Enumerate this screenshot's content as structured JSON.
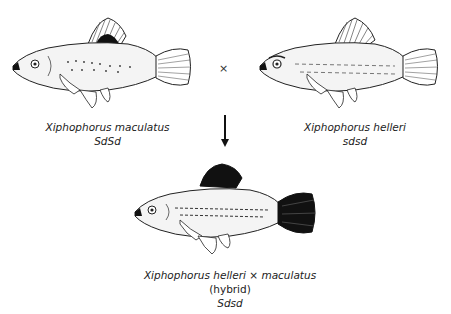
{
  "figure": {
    "parents": [
      {
        "species": "Xiphophorus maculatus",
        "genotype": "SdSd",
        "dorsal_fin_spot": "black",
        "tail_color": "light"
      },
      {
        "species": "Xiphophorus helleri",
        "genotype": "sdsd",
        "dorsal_fin_spot": "none",
        "tail_color": "light"
      }
    ],
    "cross_symbol": "×",
    "offspring": {
      "species_left": "Xiphophorus helleri",
      "cross_symbol": "×",
      "species_right": "maculatus",
      "note": "(hybrid)",
      "genotype": "Sdsd",
      "dorsal_fin_spot": "black",
      "tail_color": "black"
    }
  },
  "colors": {
    "ink": "#1a1a1a",
    "body_fill": "#f2f2f2",
    "background": "#ffffff"
  }
}
